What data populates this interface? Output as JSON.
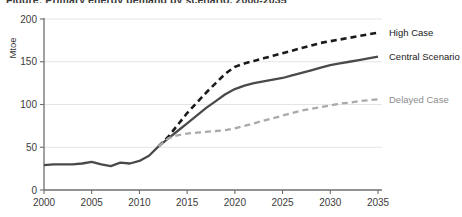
{
  "title_partial": "Figure: Primary energy demand by scenario, 2000-2035",
  "chart_data": {
    "type": "line",
    "title": "",
    "xlabel": "",
    "ylabel": "Mtoe",
    "xlim": [
      2000,
      2035
    ],
    "ylim": [
      0,
      200
    ],
    "ytick_values": [
      0,
      50,
      100,
      150,
      200
    ],
    "ytick_labels": [
      "0",
      "50",
      "100",
      "150",
      "200"
    ],
    "xtick_values": [
      2000,
      2005,
      2010,
      2015,
      2020,
      2025,
      2030,
      2035
    ],
    "xtick_labels": [
      "2000",
      "2005",
      "2010",
      "2015",
      "2020",
      "2025",
      "2030",
      "2035"
    ],
    "grid": "horizontal",
    "legend_position": "right-inline-at-line-ends",
    "series": [
      {
        "name": "High Case",
        "color": "#1a1a1a",
        "style": "dashed",
        "width": 2.6,
        "label_color": "#1a1a1a",
        "x": [
          2012,
          2013,
          2014,
          2015,
          2016,
          2017,
          2018,
          2019,
          2020,
          2021,
          2022,
          2023,
          2024,
          2025,
          2026,
          2027,
          2028,
          2029,
          2030,
          2031,
          2032,
          2033,
          2034,
          2035
        ],
        "values": [
          51,
          62,
          76,
          90,
          102,
          114,
          125,
          136,
          144,
          148,
          151,
          154,
          157,
          160,
          163,
          166,
          169,
          172,
          174,
          176,
          178,
          180,
          182,
          184
        ]
      },
      {
        "name": "Central Scenario",
        "color": "#4a4a4a",
        "style": "solid",
        "width": 2.3,
        "label_color": "#1a1a1a",
        "x": [
          2012,
          2013,
          2014,
          2015,
          2016,
          2017,
          2018,
          2019,
          2020,
          2021,
          2022,
          2023,
          2024,
          2025,
          2026,
          2027,
          2028,
          2029,
          2030,
          2031,
          2032,
          2033,
          2034,
          2035
        ],
        "values": [
          51,
          60,
          69,
          78,
          87,
          96,
          104,
          112,
          118,
          122,
          125,
          127,
          129,
          131,
          134,
          137,
          140,
          143,
          146,
          148,
          150,
          152,
          154,
          156
        ]
      },
      {
        "name": "Delayed Case",
        "color": "#aaaaaa",
        "style": "dashed",
        "width": 2.3,
        "label_color": "#8d8d8d",
        "x": [
          2012,
          2013,
          2014,
          2015,
          2016,
          2017,
          2018,
          2019,
          2020,
          2021,
          2022,
          2023,
          2024,
          2025,
          2026,
          2027,
          2028,
          2029,
          2030,
          2031,
          2032,
          2033,
          2034,
          2035
        ],
        "values": [
          51,
          60,
          64,
          66,
          67,
          68,
          69,
          70,
          72,
          75,
          78,
          81,
          84,
          87,
          90,
          93,
          95,
          97,
          99,
          101,
          102,
          104,
          105,
          106
        ]
      },
      {
        "name": "Historical",
        "color": "#4a4a4a",
        "style": "solid",
        "width": 2.3,
        "label_color": "",
        "x": [
          2000,
          2001,
          2002,
          2003,
          2004,
          2005,
          2006,
          2007,
          2008,
          2009,
          2010,
          2011,
          2012
        ],
        "values": [
          29,
          30,
          30,
          30,
          31,
          33,
          30,
          28,
          32,
          31,
          34,
          40,
          51
        ]
      }
    ]
  }
}
